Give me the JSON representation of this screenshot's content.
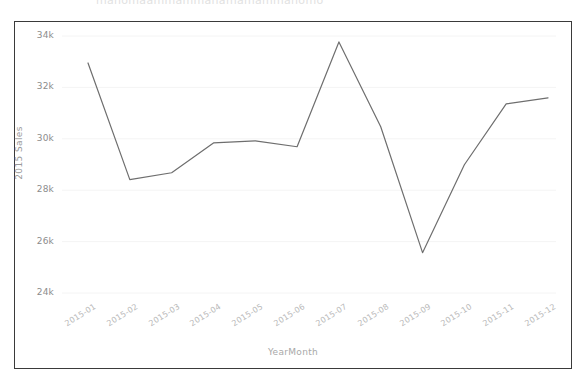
{
  "window": {
    "ghost_text": "manomaammammanamamammanomo"
  },
  "chart_data": {
    "type": "line",
    "title": "",
    "xlabel": "YearMonth",
    "ylabel": "2015 Sales",
    "categories": [
      "2015-01",
      "2015-02",
      "2015-03",
      "2015-04",
      "2015-05",
      "2015-06",
      "2015-07",
      "2015-08",
      "2015-09",
      "2015-10",
      "2015-11",
      "2015-12"
    ],
    "values": [
      32950,
      28410,
      28680,
      29840,
      29920,
      29690,
      33770,
      30470,
      25570,
      28990,
      31360,
      31590
    ],
    "series": [
      {
        "name": "2015 Sales",
        "values": [
          32950,
          28410,
          28680,
          29840,
          29920,
          29690,
          33770,
          30470,
          25570,
          28990,
          31360,
          31590
        ]
      }
    ],
    "yticks": [
      24000,
      26000,
      28000,
      30000,
      32000,
      34000
    ],
    "ytick_labels": [
      "24k",
      "26k",
      "28k",
      "30k",
      "32k",
      "34k"
    ],
    "ylim": [
      23200,
      34600
    ],
    "xlim": [
      -0.5,
      11.5
    ],
    "grid": true,
    "legend": false,
    "line_color": "#6e6e6e",
    "grid_color": "#f4f4f4",
    "background": "#ffffff"
  }
}
